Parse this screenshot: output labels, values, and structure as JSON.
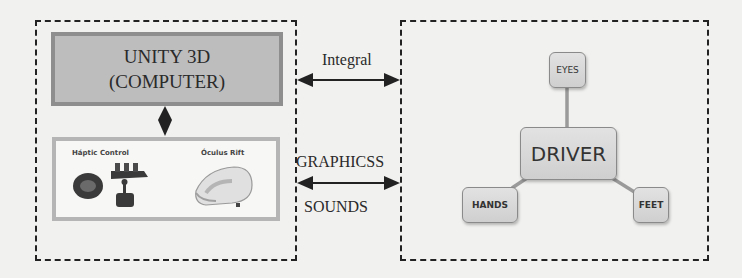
{
  "left_panel": {
    "unity_box": {
      "line1": "UNITY 3D",
      "line2": "(COMPUTER)"
    },
    "devices": {
      "haptic_label": "Háptic Control",
      "oculus_label": "Óculus Rift"
    }
  },
  "connections": {
    "top_arrow_label": "Integral",
    "bottom_arrow_label_top": "GRAPHICSS",
    "bottom_arrow_label_bottom": "SOUNDS"
  },
  "right_panel": {
    "center_node": "DRIVER",
    "nodes": {
      "top": "EYES",
      "left": "HANDS",
      "right": "FEET"
    }
  },
  "colors": {
    "background": "#f1f1ef",
    "unity_fill": "#bdbdbd",
    "unity_border": "#8e8e8e",
    "node_fill": "#d8d8d8",
    "line": "#222222",
    "connector": "#9a9a9a"
  }
}
